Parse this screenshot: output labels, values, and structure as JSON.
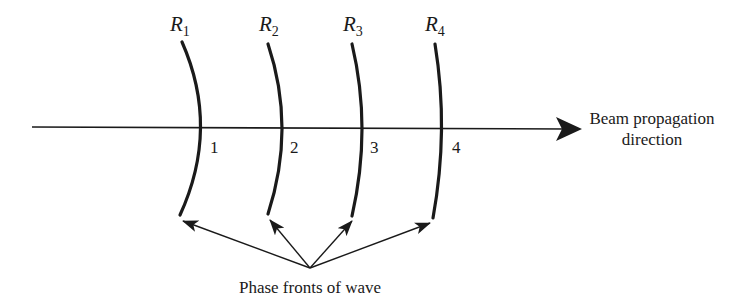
{
  "diagram": {
    "type": "beam-phase-fronts",
    "colors": {
      "ink": "#1a1a1a",
      "background": "#ffffff"
    },
    "axis": {
      "label_line1": "Beam propagation",
      "label_line2": "direction"
    },
    "fronts": [
      {
        "radius_label": "R",
        "radius_sub": "1",
        "position_label": "1"
      },
      {
        "radius_label": "R",
        "radius_sub": "2",
        "position_label": "2"
      },
      {
        "radius_label": "R",
        "radius_sub": "3",
        "position_label": "3"
      },
      {
        "radius_label": "R",
        "radius_sub": "4",
        "position_label": "4"
      }
    ],
    "caption": "Phase fronts of wave"
  }
}
